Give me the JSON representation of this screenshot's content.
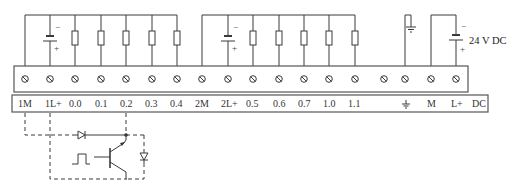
{
  "diagram": {
    "supply_label": "24 V DC",
    "battery_signs": {
      "minus": "−",
      "plus": "+"
    },
    "terminal_labels": [
      "1M",
      "1L+",
      "0.0",
      "0.1",
      "0.2",
      "0.3",
      "0.4",
      "2M",
      "2L+",
      "0.5",
      "0.6",
      "0.7",
      "1.0",
      "1.1",
      "",
      "⏚",
      "M",
      "L+",
      "DC"
    ],
    "terminal_count": 18,
    "groups": [
      {
        "name": "group-1",
        "common": "1M",
        "supply": "1L+",
        "outputs": [
          "0.0",
          "0.1",
          "0.2",
          "0.3",
          "0.4"
        ],
        "loads": 5
      },
      {
        "name": "group-2",
        "common": "2M",
        "supply": "2L+",
        "outputs": [
          "0.5",
          "0.6",
          "0.7",
          "1.0",
          "1.1"
        ],
        "loads": 5
      }
    ],
    "power_terminals": [
      "⏚",
      "M",
      "L+"
    ],
    "internal_circuit": {
      "components": [
        "diode",
        "npn-transistor",
        "pulse-input",
        "protection-diode"
      ],
      "connected_terminals": [
        "1M",
        "1L+",
        "0.2"
      ]
    },
    "colors": {
      "line": "#3a3a3a",
      "box_border": "#555555",
      "background": "#ffffff"
    }
  }
}
